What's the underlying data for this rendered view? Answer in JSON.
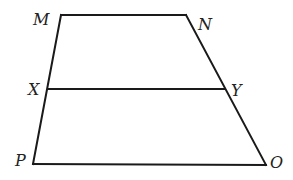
{
  "figure": {
    "type": "trapezoid-with-midsegment",
    "stroke_color": "#1a1a1a",
    "vertices": {
      "M": {
        "label": "M",
        "x": 61,
        "y": 15,
        "label_x": 33,
        "label_y": 25
      },
      "N": {
        "label": "N",
        "x": 186,
        "y": 15,
        "label_x": 198,
        "label_y": 30
      },
      "X": {
        "label": "X",
        "x": 48,
        "y": 89,
        "label_x": 28,
        "label_y": 95
      },
      "Y": {
        "label": "Y",
        "x": 225,
        "y": 89,
        "label_x": 231,
        "label_y": 96
      },
      "P": {
        "label": "P",
        "x": 33,
        "y": 164,
        "label_x": 15,
        "label_y": 166
      },
      "O": {
        "label": "O",
        "x": 266,
        "y": 165,
        "label_x": 270,
        "label_y": 168
      }
    },
    "segments": [
      {
        "name": "segment-MN",
        "from": "M",
        "to": "N"
      },
      {
        "name": "segment-MP",
        "from": "M",
        "to": "P"
      },
      {
        "name": "segment-NO",
        "from": "N",
        "to": "O"
      },
      {
        "name": "segment-PO",
        "from": "P",
        "to": "O"
      },
      {
        "name": "segment-XY",
        "from": "X",
        "to": "Y"
      }
    ]
  }
}
